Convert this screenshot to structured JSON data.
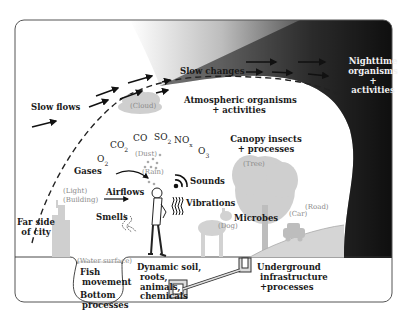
{
  "diagram": {
    "labels": {
      "slow_flows": "Slow flows",
      "slow_changes": "Slow changes",
      "nighttime_1": "Nighttime",
      "nighttime_2": "organisms",
      "nighttime_3": "+",
      "nighttime_4": "activities",
      "atmospheric_1": "Atmospheric organisms",
      "atmospheric_2": "+ activities",
      "canopy_1": "Canopy insects",
      "canopy_2": "+ processes",
      "gases": "Gases",
      "airflows": "Airflows",
      "sounds": "Sounds",
      "vibrations": "Vibrations",
      "smells": "Smells",
      "far_side_1": "Far side",
      "far_side_2": "of city",
      "microbes": "Microbes",
      "fish_1": "Fish",
      "fish_2": "movement",
      "bottom_1": "Bottom",
      "bottom_2": "processes",
      "soil_1": "Dynamic soil,",
      "soil_2": "roots,",
      "soil_3": "animals,",
      "soil_4": "chemicals",
      "underground_1": "Underground",
      "underground_2": "infrastructure",
      "underground_3": "+processes"
    },
    "sublabels": {
      "cloud": "(Cloud)",
      "dust": "(Dust)",
      "rain": "(Rain)",
      "light": "(Light)",
      "building": "(Building)",
      "tree": "(Tree)",
      "dog": "(Dog)",
      "car": "(Car)",
      "road": "(Road)",
      "water_surface": "(Water surface)"
    },
    "chemicals": {
      "o2": {
        "base": "O",
        "sub": "2"
      },
      "co2": {
        "base": "CO",
        "sub": "2"
      },
      "co": {
        "base": "CO",
        "sub": ""
      },
      "so2": {
        "base": "SO",
        "sub": "2"
      },
      "nox": {
        "base": "NO",
        "sub": "x"
      },
      "o3": {
        "base": "O",
        "sub": "3"
      }
    },
    "colors": {
      "frame": "#555555",
      "night_dark": "#111111",
      "night_mid": "#6a6a6a",
      "grey_shapes": "#c8c8c8",
      "text": "#1a1a1a"
    }
  }
}
